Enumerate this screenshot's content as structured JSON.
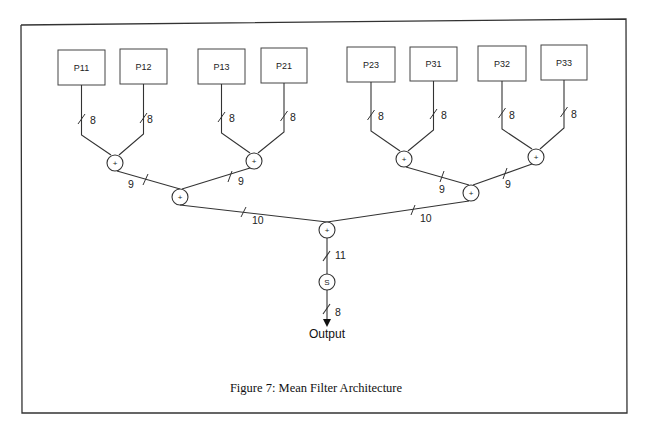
{
  "figure": {
    "caption": "Figure 7: Mean Filter Architecture"
  },
  "inputs": [
    {
      "label": "P11",
      "width": "8"
    },
    {
      "label": "P12",
      "width": "8"
    },
    {
      "label": "P13",
      "width": "8"
    },
    {
      "label": "P21",
      "width": "8"
    },
    {
      "label": "P23",
      "width": "8"
    },
    {
      "label": "P31",
      "width": "8"
    },
    {
      "label": "P32",
      "width": "8"
    },
    {
      "label": "P33",
      "width": "8"
    }
  ],
  "adders_level1": [
    {
      "symbol": "+",
      "out_width": "9"
    },
    {
      "symbol": "+",
      "out_width": "9"
    },
    {
      "symbol": "+",
      "out_width": "9"
    },
    {
      "symbol": "+",
      "out_width": "9"
    }
  ],
  "adders_level2": [
    {
      "symbol": "+",
      "out_width": "10"
    },
    {
      "symbol": "+",
      "out_width": "10"
    }
  ],
  "adder_final": {
    "symbol": "+",
    "out_width": "11"
  },
  "shifter": {
    "symbol": "S",
    "out_width": "8"
  },
  "output": {
    "label": "Output"
  }
}
